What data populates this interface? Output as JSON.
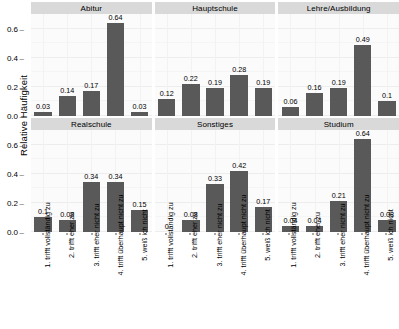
{
  "chart_data": {
    "type": "bar",
    "title": "",
    "xlabel": "",
    "ylabel": "Relative Häufigkeit",
    "ylim": [
      0,
      0.7
    ],
    "yticks": [
      "0.0",
      "0.2",
      "0.4",
      "0.6"
    ],
    "ytick_values": [
      0.0,
      0.2,
      0.4,
      0.6
    ],
    "grid": true,
    "legend": "none",
    "facet_layout": {
      "rows": 2,
      "cols": 3
    },
    "categories": [
      "1. trifft vollständig zu",
      "2. trifft eher zu",
      "3. trifft eher nicht zu",
      "4. trifft überhaupt nicht zu",
      "5. weiß ich nicht"
    ],
    "panels": [
      {
        "title": "Abitur",
        "values": [
          0.03,
          0.14,
          0.17,
          0.64,
          0.03
        ],
        "labels": [
          "0.03",
          "0.14",
          "0.17",
          "0.64",
          "0.03"
        ]
      },
      {
        "title": "Hauptschule",
        "values": [
          0.12,
          0.22,
          0.19,
          0.28,
          0.19
        ],
        "labels": [
          "0.12",
          "0.22",
          "0.19",
          "0.28",
          "0.19"
        ]
      },
      {
        "title": "Lehre/Ausbildung",
        "values": [
          0.06,
          0.16,
          0.19,
          0.49,
          0.1
        ],
        "labels": [
          "0.06",
          "0.16",
          "0.19",
          "0.49",
          "0.1"
        ]
      },
      {
        "title": "Realschule",
        "values": [
          0.1,
          0.08,
          0.34,
          0.34,
          0.15
        ],
        "labels": [
          "0.1",
          "0.08",
          "0.34",
          "0.34",
          "0.15"
        ]
      },
      {
        "title": "Sonstiges",
        "values": [
          0,
          0.08,
          0.33,
          0.42,
          0.17
        ],
        "labels": [
          "0",
          "0.08",
          "0.33",
          "0.42",
          "0.17"
        ]
      },
      {
        "title": "Studium",
        "values": [
          0.04,
          0.04,
          0.21,
          0.64,
          0.08
        ],
        "labels": [
          "0.04",
          "0.04",
          "0.21",
          "0.64",
          "0.08"
        ]
      }
    ],
    "colors": {
      "bar": "#595959",
      "panel_background": "#fbfbfb",
      "strip_background": "#d9d9d9",
      "gridline": "#ededed",
      "text": "#000000"
    }
  }
}
